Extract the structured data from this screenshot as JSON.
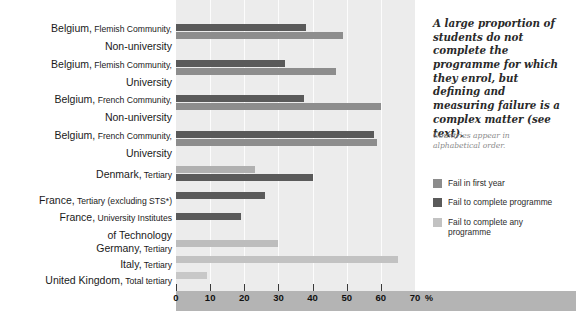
{
  "chart_data": {
    "type": "bar",
    "orientation": "horizontal",
    "title": "",
    "xlabel": "%",
    "ylabel": "",
    "xlim": [
      0,
      70
    ],
    "xticks": [
      0,
      10,
      20,
      30,
      40,
      50,
      60,
      70
    ],
    "xtick_labels": [
      "0",
      "10",
      "20",
      "30",
      "40",
      "50",
      "60",
      "70"
    ],
    "grid": true,
    "legend_position": "right",
    "unit_suffix": "%",
    "categories": [
      "Belgium, Flemish Community, Non-university",
      "Belgium, Flemish Community, University",
      "Belgium, French Community, Non-university",
      "Belgium, French Community, University",
      "Denmark, Tertiary",
      "France, Tertiary (excluding STS*)",
      "France, University Institutes of Technology",
      "Germany, Tertiary",
      "Italy, Tertiary",
      "United Kingdom, Total tertiary"
    ],
    "series": [
      {
        "name": "Fail in first year",
        "color": "#8c8c8c",
        "values": [
          null,
          null,
          null,
          null,
          23,
          null,
          null,
          null,
          null,
          null
        ]
      },
      {
        "name": "Fail to complete programme",
        "color": "#5a5a5a",
        "values": [
          38,
          32,
          37.5,
          58,
          40,
          26,
          19,
          null,
          null,
          null
        ]
      },
      {
        "name": "Fail to complete any programme",
        "color": "#b9b9b9",
        "values": [
          49,
          47,
          60,
          59,
          null,
          null,
          null,
          30,
          65,
          9
        ]
      }
    ]
  },
  "rows": [
    {
      "label_main": "Belgium,",
      "label_small": " Flemish Community,",
      "label_line2": "Non-university",
      "bars": [
        {
          "series": "Fail to complete programme",
          "value": 38,
          "color": "#5a5a5a"
        },
        {
          "series": "Fail to complete any programme",
          "value": 49,
          "color": "#8d8d8d"
        }
      ]
    },
    {
      "label_main": "Belgium,",
      "label_small": " Flemish Community,",
      "label_line2": "University",
      "bars": [
        {
          "series": "Fail to complete programme",
          "value": 32,
          "color": "#5a5a5a"
        },
        {
          "series": "Fail to complete any programme",
          "value": 47,
          "color": "#8d8d8d"
        }
      ]
    },
    {
      "label_main": "Belgium,",
      "label_small": " French Community,",
      "label_line2": "Non-university",
      "bars": [
        {
          "series": "Fail to complete programme",
          "value": 37.5,
          "color": "#5a5a5a"
        },
        {
          "series": "Fail to complete any programme",
          "value": 60,
          "color": "#8d8d8d"
        }
      ]
    },
    {
      "label_main": "Belgium,",
      "label_small": " French Community,",
      "label_line2": "University",
      "bars": [
        {
          "series": "Fail to complete programme",
          "value": 58,
          "color": "#5a5a5a"
        },
        {
          "series": "Fail to complete any programme",
          "value": 59,
          "color": "#8d8d8d"
        }
      ]
    },
    {
      "label_main": "Denmark,",
      "label_small": " Tertiary",
      "label_line2": "",
      "bars": [
        {
          "series": "Fail in first year",
          "value": 23,
          "color": "#b0b0b0"
        },
        {
          "series": "Fail to complete programme",
          "value": 40,
          "color": "#5a5a5a"
        }
      ]
    },
    {
      "label_main": "France,",
      "label_small": " Tertiary (excluding STS*)",
      "label_line2": "",
      "bars": [
        {
          "series": "Fail to complete programme",
          "value": 26,
          "color": "#5a5a5a"
        }
      ]
    },
    {
      "label_main": "France,",
      "label_small": " University Institutes",
      "label_line2": "of  Technology",
      "bars": [
        {
          "series": "Fail to complete programme",
          "value": 19,
          "color": "#5a5a5a"
        }
      ]
    },
    {
      "label_main": "Germany,",
      "label_small": " Tertiary",
      "label_line2": "",
      "bars": [
        {
          "series": "Fail to complete any programme",
          "value": 30,
          "color": "#bdbdbd"
        }
      ]
    },
    {
      "label_main": "Italy,",
      "label_small": " Tertiary",
      "label_line2": "",
      "bars": [
        {
          "series": "Fail to complete any programme",
          "value": 65,
          "color": "#c2c2c2"
        }
      ]
    },
    {
      "label_main": "United Kingdom,",
      "label_small": " Total tertiary",
      "label_line2": "",
      "bars": [
        {
          "series": "Fail to complete any programme",
          "value": 9,
          "color": "#c8c8c8"
        }
      ]
    }
  ],
  "axis": {
    "ticks": [
      "0",
      "10",
      "20",
      "30",
      "40",
      "50",
      "60",
      "70"
    ],
    "unit": "%"
  },
  "side": {
    "pullquote": "A large proportion of students do not complete the programme for which they enrol, but defining and measuring failure is a complex matter (see text).",
    "note": "Countries appear in alphabetical order.",
    "legend": [
      {
        "label": "Fail in first year",
        "color": "#8c8c8c"
      },
      {
        "label": "Fail to complete programme",
        "color": "#5a5a5a"
      },
      {
        "label": "Fail to complete any programme",
        "color": "#c2c2c2"
      }
    ]
  },
  "colors": {
    "plot_background": "#ececec",
    "axis_band": "#b4b4b4",
    "gridline": "#ffffff",
    "fail_first_year": "#8c8c8c",
    "fail_complete_programme": "#5a5a5a",
    "fail_any_programme": "#c2c2c2"
  }
}
